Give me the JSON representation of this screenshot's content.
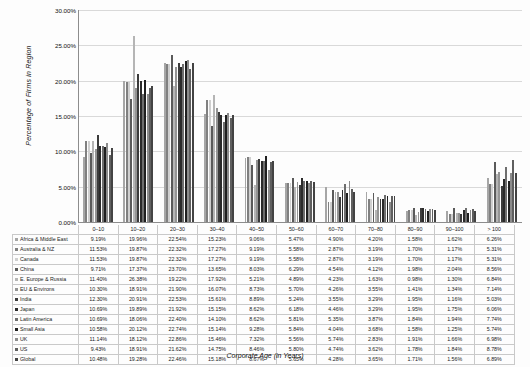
{
  "chart_data": {
    "type": "bar",
    "title": "",
    "xlabel": "Corporate Age (in Years)",
    "ylabel": "Percentage of Firms in Region",
    "ylim": [
      0,
      30
    ],
    "ytick_labels": [
      "0.00%",
      "5.00%",
      "10.00%",
      "15.00%",
      "20.00%",
      "25.00%",
      "30.00%"
    ],
    "ytick_values": [
      0,
      5,
      10,
      15,
      20,
      25,
      30
    ],
    "grid": true,
    "legend_position": "table-below",
    "categories": [
      "0–10",
      "10–20",
      "20–30",
      "30–40",
      "40–50",
      "50–60",
      "60–70",
      "70–80",
      "80–90",
      "90–100",
      "> 100"
    ],
    "series": [
      {
        "name": "Africa & Middle East",
        "color": "#a6a6a6",
        "values": [
          9.19,
          19.96,
          22.54,
          15.23,
          9.06,
          5.47,
          4.9,
          4.2,
          1.58,
          1.62,
          6.26
        ],
        "labels": [
          "9.19%",
          "19.96%",
          "22.54%",
          "15.23%",
          "9.06%",
          "5.47%",
          "4.90%",
          "4.20%",
          "1.58%",
          "1.62%",
          "6.26%"
        ]
      },
      {
        "name": "Australia & NZ",
        "color": "#808080",
        "values": [
          11.53,
          19.87,
          22.32,
          17.27,
          9.19,
          5.58,
          2.87,
          3.19,
          1.7,
          1.17,
          5.31
        ],
        "labels": [
          "11.53%",
          "19.87%",
          "22.32%",
          "17.27%",
          "9.19%",
          "5.58%",
          "2.87%",
          "3.19%",
          "1.70%",
          "1.17%",
          "5.31%"
        ]
      },
      {
        "name": "Canada",
        "color": "#cfcfcf",
        "values": [
          11.53,
          19.87,
          22.32,
          17.27,
          9.19,
          5.58,
          2.87,
          3.19,
          1.7,
          1.17,
          5.31
        ],
        "labels": [
          "11.53%",
          "19.87%",
          "22.32%",
          "17.27%",
          "9.19%",
          "5.58%",
          "2.87%",
          "3.19%",
          "1.70%",
          "1.17%",
          "5.31%"
        ]
      },
      {
        "name": "China",
        "color": "#5a5a5a",
        "values": [
          9.71,
          17.37,
          23.7,
          13.65,
          8.03,
          6.29,
          4.54,
          4.12,
          1.98,
          2.04,
          8.56
        ],
        "labels": [
          "9.71%",
          "17.37%",
          "23.70%",
          "13.65%",
          "8.03%",
          "6.29%",
          "4.54%",
          "4.12%",
          "1.98%",
          "2.04%",
          "8.56%"
        ]
      },
      {
        "name": "E. Europe & Russia",
        "color": "#b5b5b5",
        "values": [
          11.4,
          26.38,
          19.22,
          17.92,
          5.21,
          4.89,
          4.23,
          1.63,
          0.98,
          1.3,
          6.84
        ],
        "labels": [
          "11.40%",
          "26.38%",
          "19.22%",
          "17.92%",
          "5.21%",
          "4.89%",
          "4.23%",
          "1.63%",
          "0.98%",
          "1.30%",
          "6.84%"
        ]
      },
      {
        "name": "EU & Environs",
        "color": "#949494",
        "values": [
          10.3,
          18.91,
          21.9,
          16.07,
          8.73,
          5.7,
          4.26,
          3.55,
          1.41,
          1.34,
          7.14
        ],
        "labels": [
          "10.30%",
          "18.91%",
          "21.90%",
          "16.07%",
          "8.73%",
          "5.70%",
          "4.26%",
          "3.55%",
          "1.41%",
          "1.34%",
          "7.14%"
        ]
      },
      {
        "name": "India",
        "color": "#3b3b3b",
        "values": [
          12.3,
          20.91,
          22.53,
          15.61,
          8.89,
          5.24,
          3.55,
          3.29,
          1.95,
          1.16,
          5.03
        ],
        "labels": [
          "12.30%",
          "20.91%",
          "22.53%",
          "15.61%",
          "8.89%",
          "5.24%",
          "3.55%",
          "3.29%",
          "1.95%",
          "1.16%",
          "5.03%"
        ]
      },
      {
        "name": "Japan",
        "color": "#2a2a2a",
        "values": [
          10.69,
          19.89,
          21.92,
          15.15,
          8.62,
          6.18,
          4.46,
          3.29,
          1.95,
          1.75,
          6.06
        ],
        "labels": [
          "10.69%",
          "19.89%",
          "21.92%",
          "15.15%",
          "8.62%",
          "6.18%",
          "4.46%",
          "3.29%",
          "1.95%",
          "1.75%",
          "6.06%"
        ]
      },
      {
        "name": "Latin America",
        "color": "#6e6e6e",
        "values": [
          10.69,
          18.06,
          22.4,
          14.1,
          8.62,
          5.81,
          5.35,
          3.87,
          1.84,
          1.94,
          7.74
        ],
        "labels": [
          "10.69%",
          "18.06%",
          "22.40%",
          "14.10%",
          "8.62%",
          "5.81%",
          "5.35%",
          "3.87%",
          "1.84%",
          "1.94%",
          "7.74%"
        ]
      },
      {
        "name": "Small Asia",
        "color": "#1f1f1f",
        "values": [
          10.58,
          20.12,
          22.74,
          15.14,
          9.28,
          5.84,
          4.04,
          3.68,
          1.58,
          1.25,
          5.74
        ],
        "labels": [
          "10.58%",
          "20.12%",
          "22.74%",
          "15.14%",
          "9.28%",
          "5.84%",
          "4.04%",
          "3.68%",
          "1.58%",
          "1.25%",
          "5.74%"
        ]
      },
      {
        "name": "UK",
        "color": "#8c8c8c",
        "values": [
          11.14,
          18.12,
          22.86,
          15.46,
          7.32,
          5.56,
          5.74,
          2.83,
          1.91,
          1.66,
          6.98
        ],
        "labels": [
          "11.14%",
          "18.12%",
          "22.86%",
          "15.46%",
          "7.32%",
          "5.56%",
          "5.74%",
          "2.83%",
          "1.91%",
          "1.66%",
          "6.98%"
        ]
      },
      {
        "name": "US",
        "color": "#5f5f5f",
        "values": [
          9.43,
          18.91,
          21.62,
          14.75,
          8.46,
          5.8,
          4.74,
          3.62,
          1.78,
          1.84,
          8.78
        ],
        "labels": [
          "9.43%",
          "18.91%",
          "21.62%",
          "14.75%",
          "8.46%",
          "5.80%",
          "4.74%",
          "3.62%",
          "1.78%",
          "1.84%",
          "8.78%"
        ]
      },
      {
        "name": "Global",
        "color": "#434343",
        "values": [
          10.48,
          19.28,
          22.46,
          15.18,
          8.67,
          5.65,
          4.28,
          3.65,
          1.71,
          1.56,
          6.89
        ],
        "labels": [
          "10.48%",
          "19.28%",
          "22.46%",
          "15.18%",
          "8.67%",
          "5.65%",
          "4.28%",
          "3.65%",
          "1.71%",
          "1.56%",
          "6.89%"
        ]
      }
    ]
  }
}
